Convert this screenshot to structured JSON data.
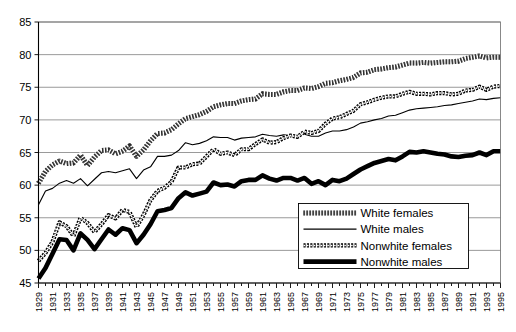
{
  "chart_data": {
    "type": "line",
    "title": "",
    "subtitle": "",
    "xlabel": "",
    "ylabel": "",
    "xlim": [
      1929,
      1995
    ],
    "ylim": [
      45,
      85
    ],
    "yticks": [
      45,
      50,
      55,
      60,
      65,
      70,
      75,
      80,
      85
    ],
    "grid": true,
    "legend_position": "bottom-right",
    "x": [
      1929,
      1930,
      1931,
      1932,
      1933,
      1934,
      1935,
      1936,
      1937,
      1938,
      1939,
      1940,
      1941,
      1942,
      1943,
      1944,
      1945,
      1946,
      1947,
      1948,
      1949,
      1950,
      1951,
      1952,
      1953,
      1954,
      1955,
      1956,
      1957,
      1958,
      1959,
      1960,
      1961,
      1962,
      1963,
      1964,
      1965,
      1966,
      1967,
      1968,
      1969,
      1970,
      1971,
      1972,
      1973,
      1974,
      1975,
      1976,
      1977,
      1978,
      1979,
      1980,
      1981,
      1982,
      1983,
      1984,
      1985,
      1986,
      1987,
      1988,
      1989,
      1990,
      1991,
      1992,
      1993,
      1994,
      1995
    ],
    "xticks": [
      1929,
      1931,
      1933,
      1935,
      1937,
      1939,
      1941,
      1943,
      1945,
      1947,
      1949,
      1951,
      1953,
      1955,
      1957,
      1959,
      1961,
      1963,
      1965,
      1967,
      1969,
      1971,
      1973,
      1975,
      1977,
      1979,
      1981,
      1983,
      1985,
      1987,
      1989,
      1991,
      1993,
      1995
    ],
    "xtick_labels": [
      "1929",
      "1931",
      "1933",
      "1935",
      "1937",
      "1939",
      "1941",
      "1943",
      "1945",
      "1947",
      "1949",
      "1951",
      "1953",
      "1955",
      "1957",
      "1959",
      "1961",
      "1963",
      "1965",
      "1967",
      "1969",
      "1971",
      "1973",
      "1975",
      "1977",
      "1979",
      "1981",
      "1983",
      "1985",
      "1987",
      "1989",
      "1991",
      "1993",
      "1995"
    ],
    "series": [
      {
        "name": "White females",
        "style": "thick-dotted",
        "color": "#666666",
        "values": [
          60.3,
          62.1,
          63.1,
          63.7,
          63.3,
          63.4,
          64.6,
          63.0,
          64.3,
          65.3,
          65.4,
          64.8,
          65.2,
          66.0,
          64.4,
          65.4,
          66.8,
          67.9,
          68.0,
          68.5,
          69.4,
          70.2,
          70.5,
          70.8,
          71.3,
          72.0,
          72.3,
          72.5,
          72.5,
          72.9,
          73.1,
          73.2,
          74.0,
          73.9,
          73.9,
          74.3,
          74.5,
          74.5,
          74.9,
          74.8,
          75.1,
          75.6,
          75.7,
          76.0,
          76.2,
          76.5,
          77.2,
          77.3,
          77.7,
          77.8,
          78.0,
          78.1,
          78.4,
          78.7,
          78.7,
          78.8,
          78.7,
          78.8,
          78.9,
          78.9,
          79.0,
          79.4,
          79.6,
          79.8,
          79.5,
          79.6,
          79.6
        ]
      },
      {
        "name": "White males",
        "style": "thin-solid",
        "color": "#000000",
        "values": [
          57.0,
          59.1,
          59.5,
          60.3,
          60.7,
          60.3,
          61.0,
          59.9,
          60.9,
          61.9,
          62.1,
          61.9,
          62.2,
          62.5,
          61.0,
          62.3,
          62.8,
          64.4,
          64.4,
          64.6,
          65.3,
          66.5,
          66.2,
          66.4,
          66.8,
          67.4,
          67.3,
          67.3,
          66.9,
          67.2,
          67.3,
          67.4,
          67.8,
          67.6,
          67.5,
          67.7,
          67.6,
          67.6,
          67.8,
          67.5,
          67.5,
          68.0,
          68.3,
          68.3,
          68.5,
          68.9,
          69.5,
          69.7,
          70.0,
          70.2,
          70.6,
          70.7,
          71.1,
          71.5,
          71.7,
          71.8,
          71.9,
          72.0,
          72.2,
          72.3,
          72.5,
          72.7,
          72.9,
          73.2,
          73.1,
          73.3,
          73.4
        ]
      },
      {
        "name": "Nonwhite females",
        "style": "medium-dotted",
        "color": "#333333",
        "values": [
          48.4,
          49.6,
          51.3,
          54.3,
          53.7,
          52.2,
          55.0,
          54.2,
          52.8,
          54.0,
          55.4,
          54.9,
          56.2,
          55.9,
          53.6,
          55.4,
          57.7,
          59.1,
          59.6,
          60.5,
          62.7,
          62.7,
          63.2,
          63.3,
          64.4,
          65.5,
          64.8,
          65.0,
          64.6,
          65.5,
          65.5,
          66.3,
          67.0,
          66.5,
          66.6,
          67.2,
          67.6,
          67.4,
          68.2,
          68.0,
          68.3,
          69.4,
          70.2,
          70.4,
          70.9,
          71.4,
          72.4,
          72.7,
          73.1,
          73.4,
          73.6,
          73.6,
          74.0,
          74.3,
          74.0,
          74.0,
          73.9,
          74.1,
          74.1,
          73.9,
          74.0,
          74.5,
          74.6,
          75.1,
          74.6,
          75.1,
          75.2
        ]
      },
      {
        "name": "Nonwhite males",
        "style": "thick-solid",
        "color": "#000000",
        "values": [
          45.7,
          47.3,
          49.5,
          51.7,
          51.6,
          50.0,
          52.6,
          51.6,
          50.2,
          51.7,
          53.2,
          52.4,
          53.4,
          53.1,
          51.1,
          52.4,
          54.0,
          56.0,
          56.2,
          56.5,
          58.0,
          58.9,
          58.4,
          58.7,
          59.0,
          60.4,
          60.0,
          60.1,
          59.8,
          60.6,
          60.8,
          60.8,
          61.5,
          61.0,
          60.7,
          61.1,
          61.1,
          60.7,
          61.1,
          60.2,
          60.6,
          60.0,
          60.8,
          60.6,
          61.0,
          61.7,
          62.4,
          62.9,
          63.4,
          63.7,
          64.0,
          63.8,
          64.4,
          65.1,
          65.0,
          65.2,
          65.0,
          64.8,
          64.7,
          64.4,
          64.3,
          64.5,
          64.6,
          65.0,
          64.6,
          65.2,
          65.2
        ]
      }
    ],
    "legend_entries": [
      {
        "label": "White females",
        "style": "thick-dotted"
      },
      {
        "label": "White males",
        "style": "thin-solid"
      },
      {
        "label": "Nonwhite females",
        "style": "medium-dotted"
      },
      {
        "label": "Nonwhite males",
        "style": "thick-solid"
      }
    ]
  }
}
